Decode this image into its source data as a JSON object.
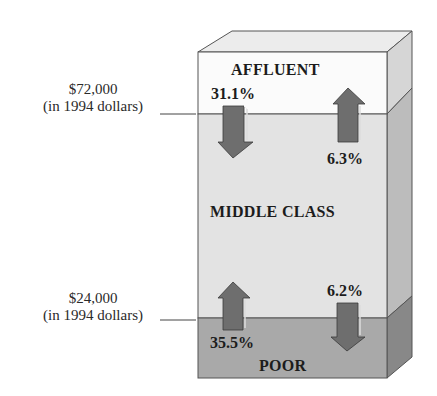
{
  "diagram": {
    "type": "3d-stacked-income-box",
    "bands": [
      {
        "name": "AFFLUENT",
        "front_color": "#fbfbfb",
        "side_color": "#d6d6d6"
      },
      {
        "name": "MIDDLE CLASS",
        "front_color": "#e3e3e3",
        "side_color": "#bcbcbc"
      },
      {
        "name": "POOR",
        "front_color": "#a9a9a9",
        "side_color": "#888888"
      }
    ],
    "top_color": "#ececec",
    "arrow_color": "#6e6e6e",
    "thresholds": [
      {
        "amount": "$72,000",
        "note": "(in 1994 dollars)"
      },
      {
        "amount": "$24,000",
        "note": "(in 1994 dollars)"
      }
    ],
    "flows": [
      {
        "label": "31.1%",
        "direction": "down",
        "from": "AFFLUENT",
        "to": "MIDDLE CLASS"
      },
      {
        "label": "6.3%",
        "direction": "up",
        "from": "MIDDLE CLASS",
        "to": "AFFLUENT"
      },
      {
        "label": "35.5%",
        "direction": "up",
        "from": "POOR",
        "to": "MIDDLE CLASS"
      },
      {
        "label": "6.2%",
        "direction": "down",
        "from": "MIDDLE CLASS",
        "to": "POOR"
      }
    ]
  }
}
